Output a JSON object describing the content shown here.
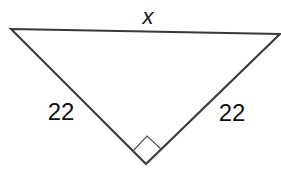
{
  "diagram": {
    "type": "right isosceles triangle",
    "labels": {
      "hypotenuse": "x",
      "left_leg": "22",
      "right_leg": "22"
    },
    "right_angle_marker": true,
    "stroke_color": "#3a3a3a"
  }
}
